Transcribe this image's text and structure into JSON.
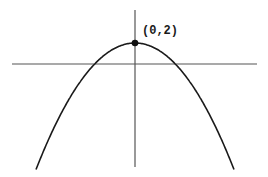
{
  "chart_data": {
    "type": "line",
    "title": "",
    "xlabel": "",
    "ylabel": "",
    "function": "y = 2 - x^2",
    "vertex": {
      "x": 0,
      "y": 2,
      "label": "(0,2)"
    },
    "x_intercepts": [
      -1.414,
      1.414
    ],
    "series": [
      {
        "name": "parabola",
        "x": [
          -2.5,
          -2,
          -1.5,
          -1,
          -0.5,
          0,
          0.5,
          1,
          1.5,
          2,
          2.5
        ],
        "y": [
          -4.25,
          -2,
          -0.25,
          1,
          1.75,
          2,
          1.75,
          1,
          -0.25,
          -2,
          -4.25
        ]
      }
    ],
    "points": [
      {
        "x": 0,
        "y": 2,
        "label": "(0,2)"
      }
    ],
    "grid": false,
    "legend": false,
    "tick_labels": false,
    "colors": {
      "curve": "#1a1a1a",
      "axes": "#555555",
      "point": "#111111"
    }
  },
  "annotations": {
    "vertex_label": "(0,2)"
  }
}
